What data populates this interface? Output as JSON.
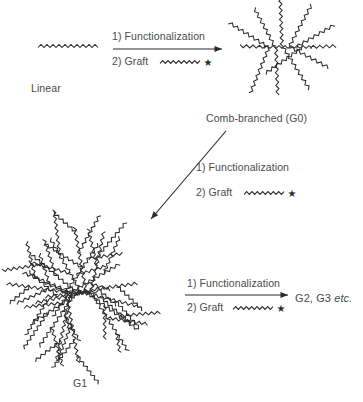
{
  "figure": {
    "type": "reaction-scheme",
    "line_color": "#2b2b2b",
    "text_color": "#4a4a4a",
    "background": "#ffffff"
  },
  "structures": {
    "linear": {
      "label": "Linear",
      "kind": "single zigzag chain",
      "cx": 68,
      "cy": 46,
      "label_x": 31,
      "label_y": 82
    },
    "g0": {
      "label": "Comb-branched (G0)",
      "kind": "comb: horizontal backbone with radiating zigzag arms",
      "cx": 288,
      "cy": 47,
      "arms": 9,
      "label_x": 206,
      "label_y": 112
    },
    "g1": {
      "label": "G1",
      "kind": "dendritic burst: radial arms each bearing secondary grafted chains",
      "cx": 80,
      "cy": 292,
      "arms": 14,
      "label_x": 73,
      "label_y": 377
    },
    "products": {
      "label": "G2, G3 ",
      "label_italic": "etc.",
      "x": 295,
      "y": 292
    }
  },
  "arrows": [
    {
      "name": "linear-to-g0",
      "orientation": "horizontal",
      "x1": 113,
      "y1": 49,
      "x2": 222,
      "y2": 49,
      "step1": "1) Functionalization",
      "step2_prefix": "2) Graft",
      "step1_x": 112,
      "step1_y": 30,
      "step2_x": 112,
      "step2_y": 55,
      "graft_motif": "zigzag-chain-with-star"
    },
    {
      "name": "g0-to-g1",
      "orientation": "diagonal-down-left",
      "x1": 226,
      "y1": 131,
      "x2": 151,
      "y2": 219,
      "step1": "1) Functionalization",
      "step2_prefix": "2) Graft",
      "step1_x": 196,
      "step1_y": 161,
      "step2_x": 196,
      "step2_y": 186,
      "graft_motif": "zigzag-chain-with-star"
    },
    {
      "name": "g1-to-higher",
      "orientation": "horizontal",
      "x1": 185,
      "y1": 295,
      "x2": 288,
      "y2": 295,
      "step1": "1) Functionalization",
      "step2_prefix": "2) Graft",
      "step1_x": 187,
      "step1_y": 277,
      "step2_x": 187,
      "step2_y": 301,
      "graft_motif": "zigzag-chain-with-star"
    }
  ],
  "legend": {
    "star_glyph": "★",
    "graft_meaning": "grafted chain bearing a reactive star end-group"
  }
}
